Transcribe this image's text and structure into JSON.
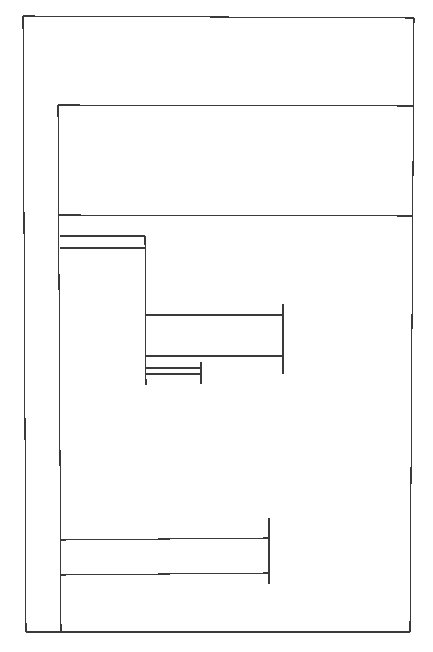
{
  "diagram": {
    "type": "nested-bracket-diagram",
    "stroke_color": "#3a3a3a",
    "background_color": "#ffffff",
    "elements": [
      {
        "id": "outer-frame",
        "kind": "frame"
      },
      {
        "id": "inner-frame",
        "kind": "frame"
      },
      {
        "id": "header-band",
        "kind": "band"
      },
      {
        "id": "bracket-a",
        "kind": "bracket",
        "bars": 2
      },
      {
        "id": "bracket-b",
        "kind": "bracket",
        "bars": 2
      },
      {
        "id": "bracket-c",
        "kind": "bracket",
        "bars": 2
      },
      {
        "id": "bracket-d",
        "kind": "bracket",
        "bars": 2
      }
    ]
  }
}
